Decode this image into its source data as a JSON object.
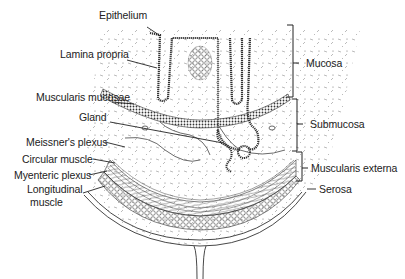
{
  "labels_left": [
    {
      "id": "epithelium",
      "text": "Epithelium",
      "x": 99,
      "y": 13
    },
    {
      "id": "lamina-propria",
      "text": "Lamina propria",
      "x": 60,
      "y": 49
    },
    {
      "id": "muscularis-mucosae",
      "text": "Muscularis mucosae",
      "x": 36,
      "y": 91
    },
    {
      "id": "gland",
      "text": "Gland",
      "x": 79,
      "y": 112
    },
    {
      "id": "meissners-plexus",
      "text": "Meissner's plexus",
      "x": 26,
      "y": 137
    },
    {
      "id": "circular-muscle",
      "text": "Circular muscle",
      "x": 22,
      "y": 153
    },
    {
      "id": "myenteric-plexus",
      "text": "Myenteric plexus",
      "x": 14,
      "y": 169
    },
    {
      "id": "longitudinal-muscle",
      "text": "Longitudinal",
      "x": 27,
      "y": 183
    },
    {
      "id": "longitudinal-muscle-2",
      "text": "muscle",
      "x": 30,
      "y": 196
    }
  ],
  "labels_right": [
    {
      "id": "mucosa",
      "text": "Mucosa",
      "x": 306,
      "y": 57
    },
    {
      "id": "submucosa",
      "text": "Submucosa",
      "x": 310,
      "y": 118
    },
    {
      "id": "muscularis-externa",
      "text": "Muscularis externa",
      "x": 311,
      "y": 162
    },
    {
      "id": "serosa",
      "text": "Serosa",
      "x": 319,
      "y": 183
    }
  ],
  "brackets": [
    {
      "name": "mucosa",
      "x": 293,
      "y1": 25,
      "y2": 97,
      "tick": 63
    },
    {
      "name": "submucosa",
      "x": 297,
      "y1": 99,
      "y2": 151,
      "tick": 124
    },
    {
      "name": "muscularis-externa",
      "x": 302,
      "y1": 152,
      "y2": 181,
      "tick": 168
    }
  ]
}
